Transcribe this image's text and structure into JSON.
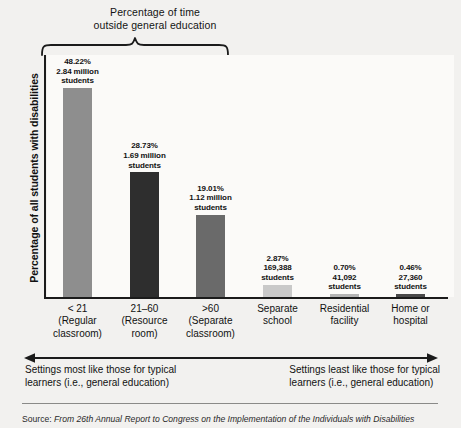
{
  "chart_data": {
    "type": "bar",
    "title": "Percentage of time outside general education",
    "xlabel": "",
    "ylabel": "Percentage of all students with disabilities",
    "ylim": [
      0,
      55
    ],
    "grid": false,
    "legend": "none",
    "categories": [
      "< 21 (Regular classroom)",
      "21–60 (Resource room)",
      ">60 (Separate classroom)",
      "Separate school",
      "Residential facility",
      "Home or hospital"
    ],
    "values": [
      48.22,
      28.73,
      19.01,
      2.87,
      0.7,
      0.46
    ],
    "counts": [
      "2.84 million students",
      "1.69 million students",
      "1.12 million students",
      "169,388 students",
      "41,092 students",
      "27,360 students"
    ],
    "bar_colors": [
      "#8e8e8e",
      "#2e2e2e",
      "#6a6a6a",
      "#c9c9c9",
      "#b4b4b4",
      "#4a4a4a"
    ],
    "annotations": [
      "Settings most like those for typical learners (i.e., general education)",
      "Settings least like those for typical learners (i.e., general education)"
    ]
  },
  "brace_title": {
    "line1": "Percentage of time",
    "line2": "outside general education"
  },
  "y_axis": {
    "label": "Percentage of all students with disabilities"
  },
  "bars": [
    {
      "key": "regular-classroom",
      "pct": "48.22%",
      "count_line1": "2.84 million",
      "count_line2": "students",
      "x_line1": "< 21",
      "x_line2": "(Regular",
      "x_line3": "classroom)",
      "color": "#8e8e8e",
      "value": 48.22
    },
    {
      "key": "resource-room",
      "pct": "28.73%",
      "count_line1": "1.69 million",
      "count_line2": "students",
      "x_line1": "21–60",
      "x_line2": "(Resource",
      "x_line3": "room)",
      "color": "#2e2e2e",
      "value": 28.73
    },
    {
      "key": "separate-classroom",
      "pct": "19.01%",
      "count_line1": "1.12 million",
      "count_line2": "students",
      "x_line1": ">60",
      "x_line2": "(Separate",
      "x_line3": "classroom)",
      "color": "#6a6a6a",
      "value": 19.01
    },
    {
      "key": "separate-school",
      "pct": "2.87%",
      "count_line1": "169,388",
      "count_line2": "students",
      "x_line1": "Separate",
      "x_line2": "school",
      "x_line3": "",
      "color": "#c9c9c9",
      "value": 2.87
    },
    {
      "key": "residential-facility",
      "pct": "0.70%",
      "count_line1": "41,092",
      "count_line2": "students",
      "x_line1": "Residential",
      "x_line2": "facility",
      "x_line3": "",
      "color": "#b4b4b4",
      "value": 0.7
    },
    {
      "key": "home-or-hospital",
      "pct": "0.46%",
      "count_line1": "27,360",
      "count_line2": "students",
      "x_line1": "Home or",
      "x_line2": "hospital",
      "x_line3": "",
      "color": "#4a4a4a",
      "value": 0.46
    }
  ],
  "captions": {
    "left_line1": "Settings most like those for typical",
    "left_line2": "learners (i.e., general education)",
    "right_line1": "Settings least like those for typical",
    "right_line2": "learners (i.e., general education)"
  },
  "source": {
    "lead": "Source:",
    "text": "From 26th Annual Report to Congress on the Implementation of the Individuals with Disabilities"
  },
  "colors": {
    "page_background": "#f2f1ef",
    "plot_background": "#fbfaf8",
    "axis": "#1b1b1b",
    "text": "#111111",
    "rule": "#8a8a88"
  }
}
